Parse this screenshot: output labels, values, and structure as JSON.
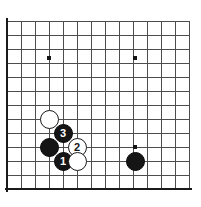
{
  "board": {
    "kind": "go-board-diagram",
    "title": "Go board corner diagram",
    "columns": 14,
    "rows": 13,
    "cell_size": 14,
    "origin_x": 7,
    "origin_y": 21,
    "line_color": "#4d4d4d",
    "edge_color": "#1a1a1a",
    "background_color": "#ffffff",
    "edges": {
      "left": true,
      "bottom": true,
      "top": false,
      "right": false
    },
    "star_points": [
      {
        "name": "star-point-upper-left",
        "x": 49,
        "y": 58
      },
      {
        "name": "star-point-upper-right",
        "x": 135,
        "y": 58
      },
      {
        "name": "star-point-lower-right",
        "x": 135,
        "y": 147
      }
    ],
    "star_color": "#151515",
    "star_size": 4
  },
  "stones": [
    {
      "name": "white-stone-upper",
      "color": "white",
      "label": "",
      "x": 49,
      "y": 119,
      "diameter": 19
    },
    {
      "name": "black-stone-move-3",
      "color": "black",
      "label": "3",
      "x": 63,
      "y": 133,
      "diameter": 19
    },
    {
      "name": "black-stone-left",
      "color": "black",
      "label": "",
      "x": 49,
      "y": 147,
      "diameter": 19
    },
    {
      "name": "white-stone-move-2",
      "color": "white",
      "label": "2",
      "x": 77,
      "y": 147,
      "diameter": 19
    },
    {
      "name": "black-stone-move-1",
      "color": "black",
      "label": "1",
      "x": 63,
      "y": 161,
      "diameter": 19
    },
    {
      "name": "white-stone-lower",
      "color": "white",
      "label": "",
      "x": 77,
      "y": 161,
      "diameter": 19
    },
    {
      "name": "black-stone-right",
      "color": "black",
      "label": "",
      "x": 135,
      "y": 161,
      "diameter": 19
    }
  ]
}
